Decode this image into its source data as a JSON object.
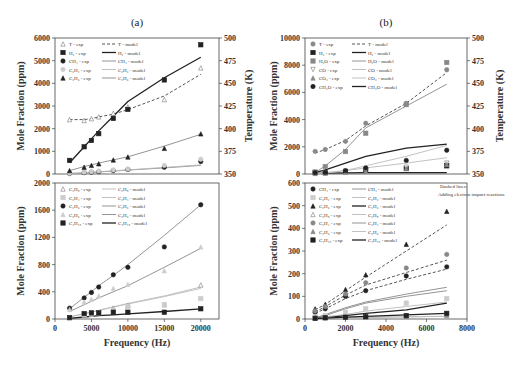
{
  "chart_data": [
    {
      "panel": "(a)",
      "type": "line",
      "subplot": "top",
      "title": "(a)",
      "xlabel": "",
      "ylabel": "Mole Fraction (ppm)",
      "y2label": "Temperature (K)",
      "x": [
        2000,
        4000,
        5000,
        6000,
        8000,
        10000,
        15000,
        20000
      ],
      "xlim": [
        0,
        22500
      ],
      "ylim": [
        0,
        6000
      ],
      "y2lim": [
        350,
        500
      ],
      "yticks": [
        "0",
        "1000",
        "2000",
        "3000",
        "4000",
        "5000",
        "6000"
      ],
      "y2ticks": [
        "350",
        "375",
        "400",
        "425",
        "450",
        "475",
        "500"
      ],
      "series": [
        {
          "name": "T - exp",
          "axis": "right",
          "marker": "open-triangle",
          "values": [
            410,
            409,
            411,
            413,
            417,
            424,
            432,
            467
          ]
        },
        {
          "name": "T - model",
          "axis": "right",
          "style": "dashed",
          "values": [
            410,
            410,
            411,
            413,
            416,
            421,
            436,
            460
          ]
        },
        {
          "name": "H2 - exp",
          "marker": "filled-square",
          "values": [
            600,
            1200,
            1480,
            1780,
            2450,
            2850,
            4150,
            5700
          ]
        },
        {
          "name": "H2 - model",
          "style": "solid-thick",
          "values": [
            500,
            1200,
            1550,
            1900,
            2550,
            3200,
            4250,
            5150
          ]
        },
        {
          "name": "CH4 - exp",
          "marker": "filled-circle",
          "values": [
            20,
            60,
            80,
            100,
            150,
            200,
            300,
            550
          ]
        },
        {
          "name": "CH4 - model",
          "style": "solid",
          "values": [
            20,
            50,
            70,
            90,
            130,
            170,
            270,
            380
          ]
        },
        {
          "name": "C2H2 - exp",
          "marker": "light-circle",
          "values": [
            30,
            80,
            100,
            130,
            180,
            220,
            380,
            650
          ]
        },
        {
          "name": "C2H2 - model",
          "style": "solid-light",
          "values": [
            25,
            60,
            80,
            100,
            140,
            180,
            290,
            400
          ]
        },
        {
          "name": "C2H6 - exp",
          "marker": "filled-triangle",
          "values": [
            150,
            300,
            380,
            450,
            620,
            750,
            1130,
            1770
          ]
        },
        {
          "name": "C2H6 - model",
          "style": "solid",
          "values": [
            150,
            330,
            400,
            480,
            620,
            760,
            1230,
            1750
          ]
        }
      ]
    },
    {
      "panel": "(a)",
      "type": "line",
      "subplot": "bottom",
      "xlabel": "Frequency (Hz)",
      "ylabel": "Mole Fraction (ppm)",
      "x": [
        2000,
        4000,
        5000,
        6000,
        8000,
        10000,
        15000,
        20000
      ],
      "xlim": [
        0,
        22500
      ],
      "ylim": [
        0,
        2000
      ],
      "xticks": [
        "0",
        "5000",
        "10000",
        "15000",
        "20000"
      ],
      "yticks": [
        "0",
        "400",
        "800",
        "1200",
        "1600",
        "2000"
      ],
      "series": [
        {
          "name": "C3H8 - exp",
          "marker": "open-triangle",
          "values": [
            20,
            60,
            80,
            100,
            160,
            200,
            210,
            500
          ]
        },
        {
          "name": "C3H8 - model",
          "style": "solid-light",
          "values": [
            30,
            80,
            100,
            130,
            180,
            230,
            340,
            470
          ]
        },
        {
          "name": "C2H4 - exp",
          "marker": "light-square",
          "values": [
            20,
            60,
            70,
            90,
            130,
            180,
            210,
            300
          ]
        },
        {
          "name": "C2H4 - model",
          "style": "solid-light",
          "values": [
            30,
            80,
            100,
            125,
            175,
            220,
            330,
            450
          ]
        },
        {
          "name": "C3H6 - exp",
          "marker": "filled-circle",
          "values": [
            160,
            310,
            390,
            470,
            650,
            760,
            1060,
            1680
          ]
        },
        {
          "name": "C3H6 - model",
          "style": "solid",
          "values": [
            150,
            320,
            400,
            490,
            640,
            800,
            1230,
            1680
          ]
        },
        {
          "name": "C2H6 - exp",
          "marker": "light-triangle",
          "values": [
            140,
            250,
            290,
            340,
            450,
            510,
            710,
            1060
          ]
        },
        {
          "name": "C2H6 - model",
          "style": "solid",
          "values": [
            110,
            210,
            260,
            310,
            400,
            490,
            760,
            1040
          ]
        },
        {
          "name": "C4H10 - exp",
          "marker": "filled-square",
          "values": [
            20,
            80,
            90,
            90,
            100,
            100,
            100,
            150
          ]
        },
        {
          "name": "C4H10 - model",
          "style": "solid-thick",
          "values": [
            10,
            30,
            40,
            50,
            60,
            75,
            110,
            150
          ]
        }
      ]
    },
    {
      "panel": "(b)",
      "type": "line",
      "subplot": "top",
      "title": "(b)",
      "xlabel": "",
      "ylabel": "Mole Fraction (ppm)",
      "y2label": "Temperature (K)",
      "x": [
        500,
        1000,
        2000,
        3000,
        5000,
        7000
      ],
      "xlim": [
        0,
        8000
      ],
      "ylim": [
        0,
        10000
      ],
      "y2lim": [
        350,
        500
      ],
      "yticks": [
        "0",
        "2000",
        "4000",
        "6000",
        "8000",
        "10000"
      ],
      "y2ticks": [
        "350",
        "375",
        "400",
        "425",
        "450",
        "475",
        "500"
      ],
      "series": [
        {
          "name": "T - exp",
          "axis": "right",
          "marker": "circle",
          "values": [
            375,
            377,
            386,
            406,
            428,
            465
          ]
        },
        {
          "name": "T - model",
          "axis": "right",
          "style": "dashed",
          "values": [
            373,
            377,
            387,
            403,
            428,
            462
          ]
        },
        {
          "name": "H2 - exp",
          "marker": "filled-square",
          "values": [
            100,
            100,
            200,
            300,
            400,
            600
          ]
        },
        {
          "name": "H2 - model",
          "style": "solid-thick",
          "values": [
            50,
            60,
            80,
            100,
            100,
            100
          ]
        },
        {
          "name": "H2O - exp",
          "marker": "square",
          "values": [
            150,
            550,
            1650,
            3000,
            5100,
            8200
          ]
        },
        {
          "name": "H2O - model",
          "style": "solid",
          "values": [
            100,
            600,
            1800,
            3400,
            5000,
            6600
          ]
        },
        {
          "name": "CO - exp",
          "marker": "open-inverted-triangle",
          "values": [
            50,
            80,
            150,
            250,
            500,
            800
          ]
        },
        {
          "name": "CO - model",
          "style": "solid-light",
          "values": [
            50,
            100,
            250,
            450,
            800,
            1200
          ]
        },
        {
          "name": "CO2 - exp",
          "marker": "triangle",
          "values": [
            40,
            60,
            120,
            200,
            400,
            700
          ]
        },
        {
          "name": "CO2 - model",
          "style": "solid-light",
          "values": [
            30,
            60,
            250,
            600,
            1300,
            2100
          ]
        },
        {
          "name": "CH2O - exp",
          "marker": "filled-circle",
          "values": [
            100,
            120,
            250,
            450,
            1000,
            1750
          ]
        },
        {
          "name": "CH2O - model",
          "style": "solid-thick",
          "values": [
            100,
            300,
            800,
            1300,
            1900,
            2200
          ]
        }
      ]
    },
    {
      "panel": "(b)",
      "type": "line",
      "subplot": "bottom",
      "xlabel": "Frequency (Hz)",
      "ylabel": "Mole Fraction (ppm)",
      "annotation": [
        "Dashed lines:",
        "Adding electron impact reactions"
      ],
      "x": [
        500,
        1000,
        2000,
        3000,
        5000,
        7000
      ],
      "xlim": [
        0,
        8000
      ],
      "ylim": [
        0,
        600
      ],
      "xticks": [
        "0",
        "2000",
        "4000",
        "6000",
        "8000"
      ],
      "yticks": [
        "0",
        "100",
        "200",
        "300",
        "400",
        "500",
        "600"
      ],
      "series": [
        {
          "name": "CH4 - exp",
          "marker": "filled-circle",
          "values": [
            30,
            45,
            100,
            125,
            190,
            230
          ]
        },
        {
          "name": "CH4 - model",
          "style": "solid",
          "values": [
            5,
            20,
            50,
            75,
            110,
            140
          ]
        },
        {
          "name": "CH4 - model (dashed)",
          "style": "dashed",
          "values": [
            25,
            45,
            90,
            125,
            175,
            220
          ]
        },
        {
          "name": "C2H2 - exp",
          "marker": "light-square",
          "values": [
            10,
            15,
            30,
            45,
            70,
            90
          ]
        },
        {
          "name": "C2H2 - model",
          "style": "solid-light",
          "values": [
            5,
            10,
            20,
            35,
            55,
            75
          ]
        },
        {
          "name": "C2H6 - exp",
          "marker": "filled-triangle",
          "values": [
            45,
            65,
            130,
            195,
            330,
            475
          ]
        },
        {
          "name": "C2H6 - model",
          "style": "solid-thick",
          "values": [
            3,
            5,
            15,
            25,
            40,
            70
          ]
        },
        {
          "name": "C2H6 - model (dashed)",
          "style": "dashed",
          "values": [
            40,
            65,
            125,
            185,
            300,
            415
          ]
        },
        {
          "name": "C3H8 - exp",
          "marker": "open-triangle",
          "values": [
            5,
            8,
            10,
            12,
            15,
            20
          ]
        },
        {
          "name": "C3H8 - model",
          "style": "solid-light",
          "values": [
            2,
            4,
            6,
            8,
            10,
            12
          ]
        },
        {
          "name": "C2H4 - exp",
          "marker": "circle",
          "values": [
            35,
            55,
            110,
            160,
            225,
            285
          ]
        },
        {
          "name": "C2H4 - model",
          "style": "solid",
          "values": [
            5,
            15,
            45,
            70,
            100,
            125
          ]
        },
        {
          "name": "C2H4 - model (dashed)",
          "style": "dashed",
          "values": [
            30,
            55,
            105,
            150,
            205,
            260
          ]
        },
        {
          "name": "C3H6 - exp",
          "marker": "triangle",
          "values": [
            5,
            8,
            10,
            10,
            12,
            15
          ]
        },
        {
          "name": "C3H6 - model",
          "style": "solid-light",
          "values": [
            2,
            3,
            5,
            7,
            9,
            12
          ]
        },
        {
          "name": "C4H10 - exp",
          "marker": "filled-square",
          "values": [
            3,
            5,
            8,
            10,
            15,
            25
          ]
        },
        {
          "name": "C4H10 - model",
          "style": "solid-thick",
          "values": [
            2,
            4,
            8,
            12,
            18,
            25
          ]
        }
      ]
    }
  ],
  "figure": {
    "panel_a_title": "(a)",
    "panel_b_title": "(b)",
    "ylabel": "Mole Fraction (ppm)",
    "y2label": "Temperature (K)",
    "xlabel": "Frequency (Hz)",
    "annotation_line1": "Dashed lines:",
    "annotation_line2": "Adding electron impact reactions",
    "legend_a_top": [
      "T - exp",
      "T - model",
      "H₂ - exp",
      "H₂ - model",
      "CH₄ - exp",
      "CH₄ - model",
      "C₂H₂ - exp",
      "C₂H₂ - model",
      "C₂H₆ - exp",
      "C₂H₆ - model"
    ],
    "legend_a_bottom": [
      "C₃H₈ - exp",
      "C₃H₈ - model",
      "C₂H₄ - exp",
      "C₂H₄ - model",
      "C₃H₆ - exp",
      "C₃H₆ - model",
      "C₂H₆ - exp",
      "C₂H₆ - model",
      "C₄H₁₀ - exp",
      "C₄H₁₀ - model"
    ],
    "legend_b_top": [
      "T - exp",
      "T - model",
      "H₂ - exp",
      "H₂ - model",
      "H₂O - exp",
      "H₂O - model",
      "CO - exp",
      "CO - model",
      "CO₂ - exp",
      "CO₂ - model",
      "CH₂O - exp",
      "CH₂O - model"
    ],
    "legend_b_bottom": [
      "CH₄ - exp",
      "CH₄ - model",
      "C₂H₂ - exp",
      "C₂H₂ - model",
      "C₂H₆ - exp",
      "C₂H₆ - model",
      "C₃H₈ - exp",
      "C₃H₈ - model",
      "C₂H₄ - exp",
      "C₂H₄ - model",
      "C₃H₆ - exp",
      "C₃H₆ - model",
      "C₄H₁₀ - exp",
      "C₄H₁₀ - model"
    ]
  }
}
